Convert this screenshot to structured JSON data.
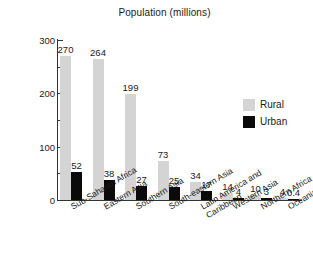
{
  "chart_data": {
    "type": "bar",
    "title": "Population (millions)",
    "xlabel": "",
    "ylabel": "",
    "ylim": [
      0,
      300
    ],
    "yticks": [
      0,
      100,
      200,
      300
    ],
    "yticks_minor": [
      50,
      150,
      250
    ],
    "grid": false,
    "legend_position": "right",
    "categories": [
      "Sub-Saharan Africa",
      "Eastern Asia",
      "Southern Asia",
      "South-eastern Asia",
      "Latin America and Caribbean",
      "Western Asia",
      "Northern Africa",
      "Oceania"
    ],
    "series": [
      {
        "name": "Rural",
        "color": "#d4d4d4",
        "values": [
          270,
          264,
          199,
          73,
          34,
          14,
          10,
          4
        ],
        "labels": [
          "270",
          "264",
          "199",
          "73",
          "34",
          "14",
          "10",
          "4"
        ]
      },
      {
        "name": "Urban",
        "color": "#0a0a0a",
        "values": [
          52,
          38,
          27,
          25,
          17,
          4,
          3,
          0.4
        ],
        "labels": [
          "52",
          "38",
          "27",
          "25",
          "17",
          "4",
          "3",
          "0.4"
        ]
      }
    ]
  },
  "axis": {
    "tick_labels": [
      "300",
      "200",
      "100",
      "0"
    ]
  },
  "category_labels": [
    {
      "line1": "Sub-Saharan Africa",
      "line2": ""
    },
    {
      "line1": "Eastern Asia",
      "line2": ""
    },
    {
      "line1": "Southern Asia",
      "line2": ""
    },
    {
      "line1": "South-eastern Asia",
      "line2": ""
    },
    {
      "line1": "Latin America and",
      "line2": "Caribbean"
    },
    {
      "line1": "Western Asia",
      "line2": ""
    },
    {
      "line1": "Northern Africa",
      "line2": ""
    },
    {
      "line1": "Oceania",
      "line2": ""
    }
  ],
  "legend": {
    "items": [
      {
        "label": "Rural",
        "swatch": "rural"
      },
      {
        "label": "Urban",
        "swatch": "urban"
      }
    ]
  }
}
